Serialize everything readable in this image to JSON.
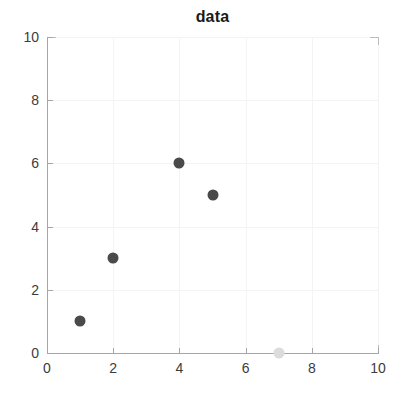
{
  "chart_data": {
    "type": "scatter",
    "title": "data",
    "xlabel": "",
    "ylabel": "",
    "xlim": [
      0,
      10
    ],
    "ylim": [
      0,
      10
    ],
    "xticks": [
      0,
      2,
      4,
      6,
      8,
      10
    ],
    "yticks": [
      0,
      2,
      4,
      6,
      8,
      10
    ],
    "xtick_labels": [
      "0",
      "2",
      "4",
      "6",
      "8",
      "10"
    ],
    "ytick_labels": [
      "0",
      "2",
      "4",
      "6",
      "8",
      "10"
    ],
    "grid": true,
    "legend": null,
    "series": [
      {
        "name": "data",
        "marker": "circle",
        "points": [
          {
            "x": 1,
            "y": 1,
            "color": "#4a4a4a",
            "size": 11
          },
          {
            "x": 2,
            "y": 3,
            "color": "#4a4a4a",
            "size": 11
          },
          {
            "x": 4,
            "y": 6,
            "color": "#4a4a4a",
            "size": 11
          },
          {
            "x": 5,
            "y": 5,
            "color": "#4a4a4a",
            "size": 11
          },
          {
            "x": 7,
            "y": 0,
            "color": "#dcdcdc",
            "size": 11
          }
        ]
      }
    ]
  },
  "colors": {
    "marker_dark": "#4a4a4a",
    "marker_light": "#dcdcdc",
    "axis": "#a6a6a6",
    "grid": "#f4f4f4",
    "text": "#3c3c3c",
    "title": "#1a1a1a",
    "background": "#ffffff"
  }
}
